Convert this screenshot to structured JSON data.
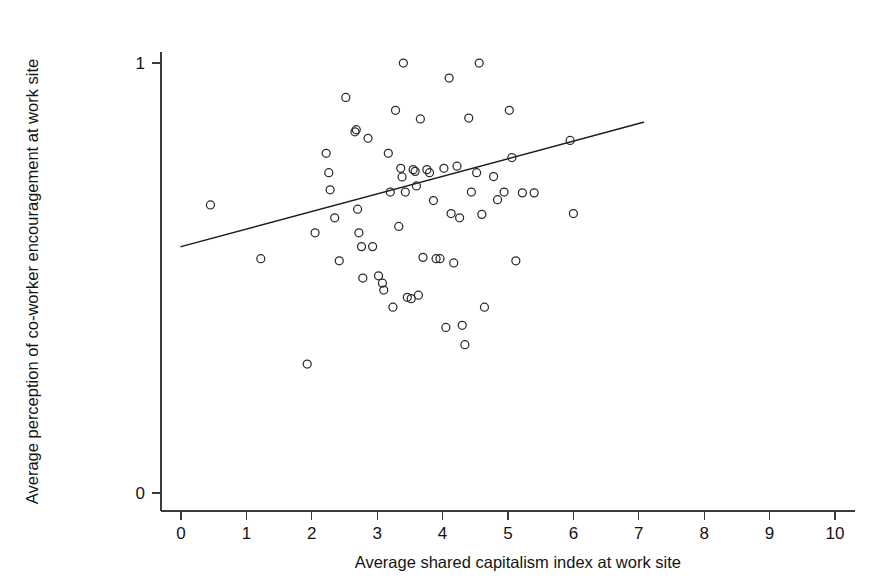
{
  "chart_data": {
    "type": "scatter",
    "title": "",
    "xlabel": "Average shared capitalism index at work site",
    "ylabel": "Average perception of co-worker encouragement at work site",
    "xlim": [
      0,
      10.3
    ],
    "ylim": [
      0,
      1.07
    ],
    "grid": false,
    "legend": null,
    "xticks": [
      0,
      1,
      2,
      3,
      4,
      5,
      6,
      7,
      8,
      9,
      10
    ],
    "xticklabels": [
      "0",
      "1",
      "2",
      "3",
      "4",
      "5",
      "6",
      "7",
      "8",
      "9",
      "10"
    ],
    "yticks": [
      0,
      1
    ],
    "yticklabels": [
      "0",
      "1"
    ],
    "marker": "open-circle",
    "marker_size_px": 8,
    "n_points": 68,
    "points": [
      {
        "x": 0.45,
        "y": 0.67
      },
      {
        "x": 1.22,
        "y": 0.545
      },
      {
        "x": 1.93,
        "y": 0.3
      },
      {
        "x": 2.05,
        "y": 0.605
      },
      {
        "x": 2.22,
        "y": 0.79
      },
      {
        "x": 2.26,
        "y": 0.745
      },
      {
        "x": 2.28,
        "y": 0.705
      },
      {
        "x": 2.35,
        "y": 0.64
      },
      {
        "x": 2.42,
        "y": 0.54
      },
      {
        "x": 2.52,
        "y": 0.92
      },
      {
        "x": 2.66,
        "y": 0.84
      },
      {
        "x": 2.68,
        "y": 0.845
      },
      {
        "x": 2.7,
        "y": 0.66
      },
      {
        "x": 2.72,
        "y": 0.605
      },
      {
        "x": 2.76,
        "y": 0.573
      },
      {
        "x": 2.78,
        "y": 0.5
      },
      {
        "x": 2.86,
        "y": 0.825
      },
      {
        "x": 2.93,
        "y": 0.573
      },
      {
        "x": 3.02,
        "y": 0.505
      },
      {
        "x": 3.08,
        "y": 0.488
      },
      {
        "x": 3.1,
        "y": 0.472
      },
      {
        "x": 3.17,
        "y": 0.79
      },
      {
        "x": 3.2,
        "y": 0.7
      },
      {
        "x": 3.24,
        "y": 0.432
      },
      {
        "x": 3.28,
        "y": 0.89
      },
      {
        "x": 3.33,
        "y": 0.62
      },
      {
        "x": 3.36,
        "y": 0.755
      },
      {
        "x": 3.38,
        "y": 0.735
      },
      {
        "x": 3.4,
        "y": 1.0
      },
      {
        "x": 3.43,
        "y": 0.7
      },
      {
        "x": 3.46,
        "y": 0.455
      },
      {
        "x": 3.52,
        "y": 0.452
      },
      {
        "x": 3.55,
        "y": 0.752
      },
      {
        "x": 3.58,
        "y": 0.748
      },
      {
        "x": 3.6,
        "y": 0.714
      },
      {
        "x": 3.63,
        "y": 0.46
      },
      {
        "x": 3.66,
        "y": 0.87
      },
      {
        "x": 3.7,
        "y": 0.548
      },
      {
        "x": 3.76,
        "y": 0.752
      },
      {
        "x": 3.8,
        "y": 0.745
      },
      {
        "x": 3.86,
        "y": 0.68
      },
      {
        "x": 3.9,
        "y": 0.545
      },
      {
        "x": 3.96,
        "y": 0.545
      },
      {
        "x": 4.02,
        "y": 0.755
      },
      {
        "x": 4.05,
        "y": 0.385
      },
      {
        "x": 4.1,
        "y": 0.965
      },
      {
        "x": 4.13,
        "y": 0.65
      },
      {
        "x": 4.17,
        "y": 0.535
      },
      {
        "x": 4.22,
        "y": 0.76
      },
      {
        "x": 4.26,
        "y": 0.64
      },
      {
        "x": 4.3,
        "y": 0.39
      },
      {
        "x": 4.34,
        "y": 0.345
      },
      {
        "x": 4.4,
        "y": 0.872
      },
      {
        "x": 4.44,
        "y": 0.7
      },
      {
        "x": 4.52,
        "y": 0.745
      },
      {
        "x": 4.56,
        "y": 1.0
      },
      {
        "x": 4.6,
        "y": 0.648
      },
      {
        "x": 4.64,
        "y": 0.432
      },
      {
        "x": 4.78,
        "y": 0.736
      },
      {
        "x": 4.84,
        "y": 0.682
      },
      {
        "x": 4.94,
        "y": 0.7
      },
      {
        "x": 5.02,
        "y": 0.89
      },
      {
        "x": 5.06,
        "y": 0.78
      },
      {
        "x": 5.12,
        "y": 0.54
      },
      {
        "x": 5.22,
        "y": 0.698
      },
      {
        "x": 5.4,
        "y": 0.698
      },
      {
        "x": 5.95,
        "y": 0.82
      },
      {
        "x": 6.0,
        "y": 0.65
      }
    ],
    "fit_line": {
      "type": "linear-regression",
      "x_start": 0.0,
      "y_start": 0.573,
      "x_end": 7.07,
      "y_end": 0.862
    }
  },
  "axes": {
    "x_axis_name": "x-axis",
    "y_axis_name": "y-axis"
  }
}
